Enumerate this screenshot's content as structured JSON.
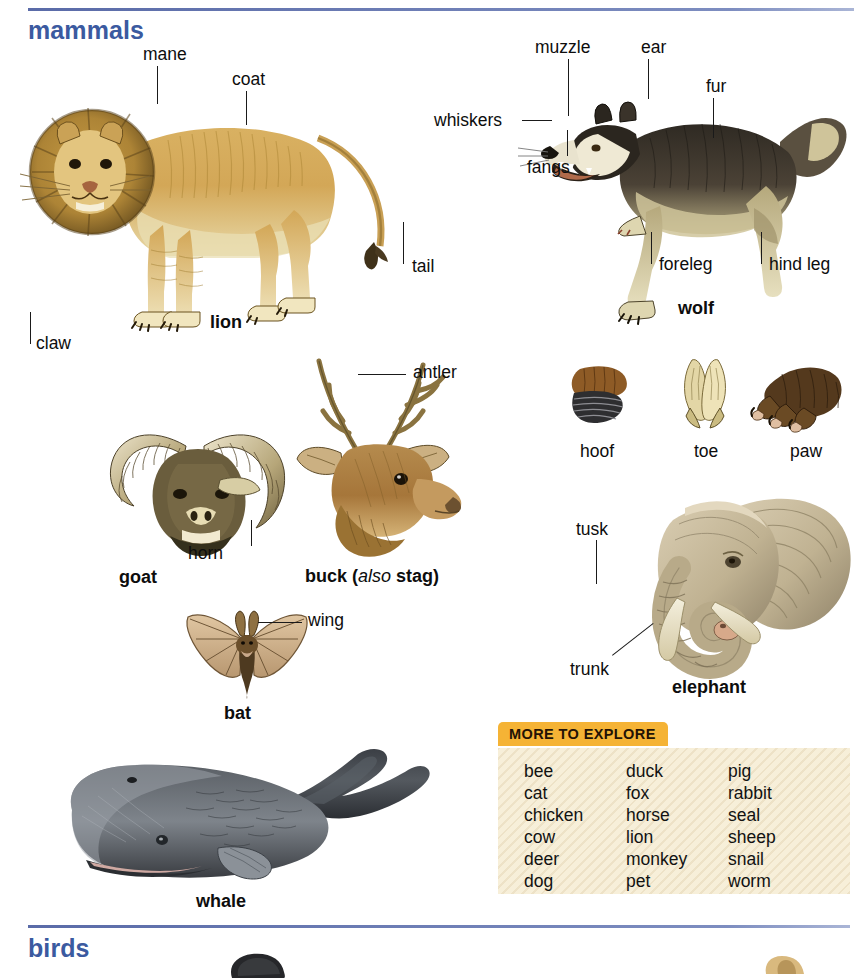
{
  "sections": [
    {
      "id": "mammals",
      "title": "mammals"
    },
    {
      "id": "birds",
      "title": "birds"
    }
  ],
  "colors": {
    "section_heading": "#3b5aa0",
    "rule": "#5a6ba8",
    "panel_tab": "#f5b335",
    "panel_body": "#f7efd9",
    "label_text": "#0d0d0d"
  },
  "illustrations": [
    {
      "id": "lion",
      "caption": "lion",
      "caption_style": "bold"
    },
    {
      "id": "wolf",
      "caption": "wolf",
      "caption_style": "bold"
    },
    {
      "id": "goat",
      "caption": "goat",
      "caption_style": "bold"
    },
    {
      "id": "buck",
      "caption_parts": [
        "buck ",
        "(",
        "also",
        " ",
        "stag",
        ")"
      ],
      "caption_style": "bold-italic"
    },
    {
      "id": "bat",
      "caption": "bat",
      "caption_style": "bold"
    },
    {
      "id": "elephant",
      "caption": "elephant",
      "caption_style": "bold"
    },
    {
      "id": "whale",
      "caption": "whale",
      "caption_style": "bold"
    },
    {
      "id": "hoof",
      "caption": "hoof",
      "caption_style": "plain"
    },
    {
      "id": "toe",
      "caption": "toe",
      "caption_style": "plain"
    },
    {
      "id": "paw",
      "caption": "paw",
      "caption_style": "plain"
    }
  ],
  "callouts": {
    "lion": [
      "mane",
      "coat",
      "tail",
      "claw"
    ],
    "wolf": [
      "muzzle",
      "ear",
      "fur",
      "whiskers",
      "fangs",
      "foreleg",
      "hind leg"
    ],
    "goat": [
      "horn"
    ],
    "buck": [
      "antler"
    ],
    "bat": [
      "wing"
    ],
    "elephant": [
      "tusk",
      "trunk"
    ]
  },
  "captions": {
    "lion": "lion",
    "wolf": "wolf",
    "goat": "goat",
    "buck_main": "buck",
    "buck_also": "also",
    "buck_alt": "stag",
    "bat": "bat",
    "elephant": "elephant",
    "whale": "whale",
    "hoof": "hoof",
    "toe": "toe",
    "paw": "paw"
  },
  "labels": {
    "mane": "mane",
    "coat": "coat",
    "tail": "tail",
    "claw": "claw",
    "muzzle": "muzzle",
    "ear": "ear",
    "fur": "fur",
    "whiskers": "whiskers",
    "fangs": "fangs",
    "foreleg": "foreleg",
    "hind_leg": "hind leg",
    "horn": "horn",
    "antler": "antler",
    "wing": "wing",
    "tusk": "tusk",
    "trunk": "trunk"
  },
  "more_to_explore": {
    "title": "MORE TO EXPLORE",
    "columns": [
      [
        "bee",
        "cat",
        "chicken",
        "cow",
        "deer",
        "dog"
      ],
      [
        "duck",
        "fox",
        "horse",
        "lion",
        "monkey",
        "pet"
      ],
      [
        "pig",
        "rabbit",
        "seal",
        "sheep",
        "snail",
        "worm"
      ]
    ]
  }
}
